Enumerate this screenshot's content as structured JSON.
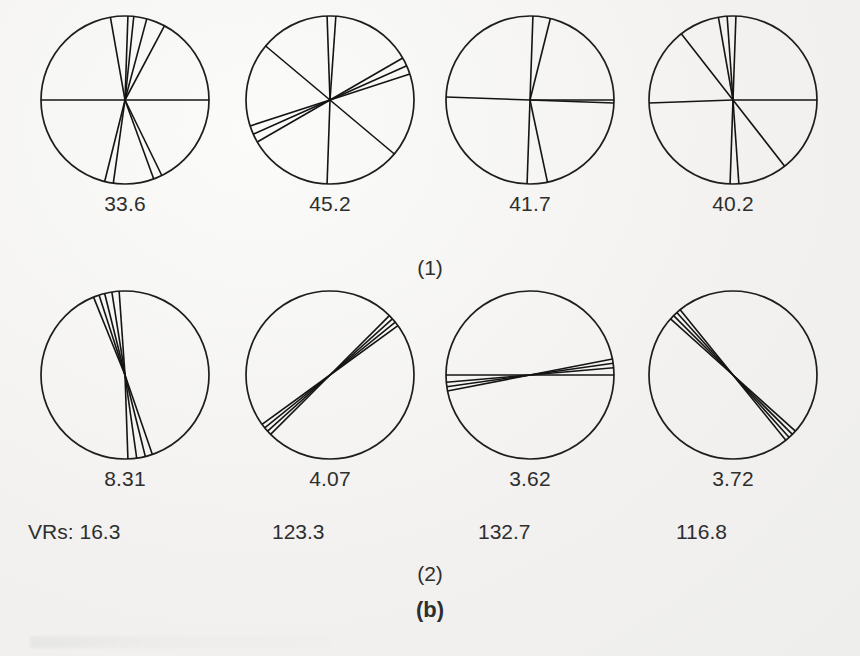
{
  "figure": {
    "panels": [
      {
        "id": "1",
        "label": "(1)",
        "discs": [
          {
            "name": "disc-1-1",
            "value": "33.6",
            "angles_deg": [
              0,
              180,
              62,
              75,
              84,
              88,
              100,
              256,
              262,
              290,
              296
            ]
          },
          {
            "name": "disc-1-2",
            "value": "45.2",
            "angles_deg": [
              86,
              92,
              30,
              24,
              18,
              140,
              210,
              204,
              198,
              320,
              268
            ]
          },
          {
            "name": "disc-1-3",
            "value": "41.7",
            "angles_deg": [
              0,
              178,
              358,
              88,
              76,
              268,
              282
            ]
          },
          {
            "name": "disc-1-4",
            "value": "40.2",
            "angles_deg": [
              88,
              94,
              100,
              128,
              0,
              182,
              268,
              274,
              308
            ]
          }
        ]
      },
      {
        "id": "2",
        "label": "(2)",
        "discs": [
          {
            "name": "disc-2-1",
            "value": "8.31",
            "angles_deg": [
              94,
              99,
              104,
              108,
              112,
              272,
              278,
              284,
              289
            ]
          },
          {
            "name": "disc-2-2",
            "value": "4.07",
            "angles_deg": [
              36,
              39,
              42,
              45,
              216,
              219,
              222,
              225
            ]
          },
          {
            "name": "disc-2-3",
            "value": "3.62",
            "angles_deg": [
              5,
              8,
              11,
              185,
              188,
              191,
              180,
              0
            ]
          },
          {
            "name": "disc-2-4",
            "value": "3.72",
            "angles_deg": [
              129,
              132,
              135,
              138,
              309,
              312,
              315,
              318
            ]
          }
        ]
      }
    ],
    "vr_row": {
      "prefix": "VRs:",
      "values": [
        "16.3",
        "123.3",
        "132.7",
        "116.8"
      ]
    },
    "sublabel": "(b)",
    "colors": {
      "ink": "#1e1e1e",
      "text": "#2e2e2e",
      "paper": "#f2f1ef"
    }
  },
  "chart_data": {
    "type": "rose-orientation-diagrams",
    "title": "(b)",
    "panels": [
      {
        "panel": "(1)",
        "circles": [
          {
            "label": "33.6",
            "line_count": 11,
            "angles_deg": [
              0,
              180,
              62,
              75,
              84,
              88,
              100,
              256,
              262,
              290,
              296
            ]
          },
          {
            "label": "45.2",
            "line_count": 11,
            "angles_deg": [
              86,
              92,
              30,
              24,
              18,
              140,
              210,
              204,
              198,
              320,
              268
            ]
          },
          {
            "label": "41.7",
            "line_count": 7,
            "angles_deg": [
              0,
              178,
              358,
              88,
              76,
              268,
              282
            ]
          },
          {
            "label": "40.2",
            "line_count": 9,
            "angles_deg": [
              88,
              94,
              100,
              128,
              0,
              182,
              268,
              274,
              308
            ]
          }
        ]
      },
      {
        "panel": "(2)",
        "circles": [
          {
            "label": "8.31",
            "line_count": 9,
            "angles_deg": [
              94,
              99,
              104,
              108,
              112,
              272,
              278,
              284,
              289
            ]
          },
          {
            "label": "4.07",
            "line_count": 8,
            "angles_deg": [
              36,
              39,
              42,
              45,
              216,
              219,
              222,
              225
            ]
          },
          {
            "label": "3.62",
            "line_count": 8,
            "angles_deg": [
              5,
              8,
              11,
              185,
              188,
              191,
              180,
              0
            ]
          },
          {
            "label": "3.72",
            "line_count": 8,
            "angles_deg": [
              129,
              132,
              135,
              138,
              309,
              312,
              315,
              318
            ]
          }
        ]
      }
    ],
    "row_labels": [
      "(1)",
      "(2)"
    ],
    "vr_label": "VRs:",
    "vr_values": [
      "16.3",
      "123.3",
      "132.7",
      "116.8"
    ],
    "upper_values": [
      "33.6",
      "45.2",
      "41.7",
      "40.2"
    ],
    "lower_values": [
      "8.31",
      "4.07",
      "3.62",
      "3.72"
    ]
  }
}
